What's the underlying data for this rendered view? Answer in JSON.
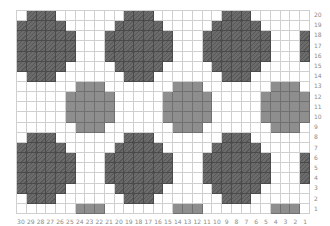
{
  "chart": {
    "type": "colorwork-grid",
    "columns": 30,
    "rows": 20,
    "legend": {
      ".": {
        "name": "background",
        "color": "#ffffff"
      },
      "D": {
        "name": "dark-contrast",
        "color": "#6b6b6b"
      },
      "L": {
        "name": "light-contrast",
        "color": "#8e8e8e"
      }
    },
    "pattern_top_to_bottom": [
      ".DDD.......DDD.......DDD......",
      "DDDDD.....DDDDD.....DDDDD.....",
      "DDDDDD...DDDDDDD...DDDDDDD...D",
      "DDDDDD...DDDDDDD...DDDDDDD...D",
      "DDDDDD...DDDDDDD...DDDDDDD...D",
      "DDDDD.....DDDDD.....DDDDD.....",
      ".DDD.......DDD.......DDD......",
      "......LLL.......LLL.......LLL.",
      ".....LLLLL.....LLLLL.....LLLLL",
      ".....LLLLL.....LLLLL.....LLLLL",
      ".....LLLLL.....LLLLL.....LLLLL",
      "......LLL.......LLL.......LLL.",
      ".DDD.......DDD.......DDD......",
      "DDDDD.....DDDDD.....DDDDD.....",
      "DDDDDD...DDDDDDD...DDDDDDD...D",
      "DDDDDD...DDDDDDD...DDDDDDD...D",
      "DDDDDD...DDDDDDD...DDDDDDD...D",
      "DDDDD.....DDDDD.....DDDDD.....",
      ".DDD.......DDD.......DDD......",
      "......LLL.......LLL.......LLL."
    ],
    "row_labels_top_to_bottom": [
      "20",
      "19",
      "18",
      "17",
      "16",
      "15",
      "14",
      "13",
      "12",
      "11",
      "10",
      "9",
      "8",
      "7",
      "6",
      "5",
      "4",
      "3",
      "2",
      "1"
    ],
    "column_labels_left_to_right": [
      "30",
      "29",
      "28",
      "27",
      "26",
      "25",
      "24",
      "23",
      "22",
      "21",
      "20",
      "19",
      "18",
      "17",
      "16",
      "15",
      "14",
      "13",
      "12",
      "11",
      "10",
      "9",
      "8",
      "7",
      "6",
      "5",
      "4",
      "3",
      "2",
      "1"
    ]
  }
}
